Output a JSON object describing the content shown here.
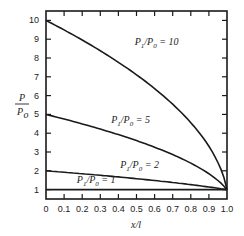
{
  "chart_data": {
    "type": "line",
    "title": "",
    "xlabel": "x/l",
    "ylabel": "P/P0",
    "xlim": [
      0,
      1.0
    ],
    "ylim": [
      0.5,
      10.5
    ],
    "grid": false,
    "x_ticks": [
      "0",
      "0.1",
      "0.2",
      "0.3",
      "0.4",
      "0.5",
      "0.6",
      "0.7",
      "0.8",
      "0.9",
      "1.0"
    ],
    "y_ticks": [
      "1",
      "2",
      "3",
      "4",
      "5",
      "6",
      "7",
      "8",
      "9",
      "10"
    ],
    "x": [
      0,
      0.1,
      0.2,
      0.3,
      0.4,
      0.5,
      0.6,
      0.7,
      0.8,
      0.9,
      0.95,
      1.0
    ],
    "series": [
      {
        "name": "P1/P0 = 10",
        "label_main": "P",
        "label_sub1": "1",
        "label_mid": "/P",
        "label_sub2": "0",
        "label_tail": " = 10",
        "values": [
          10,
          9.49,
          8.96,
          8.38,
          7.77,
          7.11,
          6.37,
          5.54,
          4.56,
          3.3,
          2.44,
          1
        ]
      },
      {
        "name": "P1/P0 = 5",
        "label_main": "P",
        "label_sub1": "1",
        "label_mid": "/P",
        "label_sub2": "0",
        "label_tail": " = 5",
        "values": [
          5,
          4.75,
          4.49,
          4.2,
          3.9,
          3.61,
          3.26,
          2.88,
          2.45,
          1.91,
          1.53,
          1
        ]
      },
      {
        "name": "P1/P0 = 2",
        "label_main": "P",
        "label_sub1": "1",
        "label_mid": "/P",
        "label_sub2": "0",
        "label_tail": " = 2",
        "values": [
          2,
          1.92,
          1.84,
          1.76,
          1.67,
          1.58,
          1.48,
          1.38,
          1.26,
          1.14,
          1.07,
          1
        ]
      },
      {
        "name": "P1/P0 = 1",
        "label_main": "P",
        "label_sub1": "1",
        "label_mid": "/P",
        "label_sub2": "0",
        "label_tail": " = 1",
        "values": [
          1,
          1,
          1,
          1,
          1,
          1,
          1,
          1,
          1,
          1,
          1,
          1
        ]
      }
    ],
    "line_color": "#1a1a1a"
  }
}
